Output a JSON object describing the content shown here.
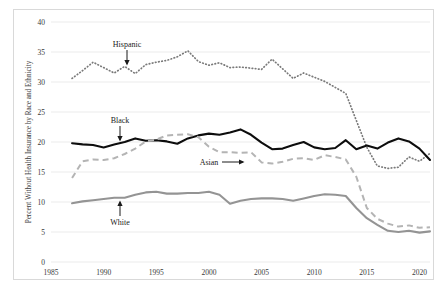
{
  "chart_data": {
    "type": "line",
    "title": "",
    "xlabel": "",
    "ylabel": "Percent Without Health Insurance by Race and Ethnicity",
    "xlim": [
      1985,
      2021
    ],
    "ylim": [
      0,
      40
    ],
    "yticks": [
      0,
      5,
      10,
      15,
      20,
      25,
      30,
      35,
      40
    ],
    "xticks": [
      1985,
      1990,
      1995,
      2000,
      2005,
      2010,
      2015,
      2020
    ],
    "grid": true,
    "legend_position": "inline-annotations",
    "x": [
      1987,
      1988,
      1989,
      1990,
      1991,
      1992,
      1993,
      1994,
      1995,
      1996,
      1997,
      1998,
      1999,
      2000,
      2001,
      2002,
      2003,
      2004,
      2005,
      2006,
      2007,
      2008,
      2009,
      2010,
      2011,
      2012,
      2013,
      2014,
      2015,
      2016,
      2017,
      2018,
      2019,
      2020,
      2021
    ],
    "series": [
      {
        "name": "Hispanic",
        "style": "dotted",
        "color": "#7a7a7a",
        "values": [
          30.6,
          31.9,
          33.3,
          32.4,
          31.5,
          32.6,
          31.4,
          32.9,
          33.3,
          33.6,
          34.2,
          35.2,
          33.4,
          32.8,
          33.2,
          32.4,
          32.5,
          32.3,
          32.1,
          33.8,
          32.2,
          30.6,
          31.5,
          30.8,
          30.1,
          29.1,
          28.1,
          23.6,
          19.1,
          16.0,
          15.6,
          15.8,
          17.5,
          16.8,
          18.1
        ]
      },
      {
        "name": "Black",
        "style": "solid",
        "color": "#0d0d0d",
        "values": [
          19.8,
          19.6,
          19.5,
          19.1,
          19.6,
          20.0,
          20.6,
          20.2,
          20.3,
          20.1,
          19.7,
          20.6,
          21.1,
          21.4,
          21.2,
          21.6,
          22.1,
          21.2,
          19.9,
          18.8,
          18.9,
          19.5,
          20.0,
          19.1,
          18.8,
          19.0,
          20.3,
          18.8,
          19.4,
          18.9,
          19.9,
          20.6,
          20.1,
          18.9,
          17.0
        ]
      },
      {
        "name": "Asian",
        "style": "dashed",
        "color": "#b4b4b4",
        "values": [
          14.0,
          16.8,
          17.1,
          17.0,
          17.3,
          18.0,
          18.9,
          20.1,
          20.4,
          21.1,
          21.2,
          21.3,
          20.8,
          19.2,
          18.3,
          18.3,
          18.2,
          18.3,
          16.6,
          16.4,
          16.7,
          17.2,
          17.3,
          17.0,
          17.8,
          17.5,
          17.1,
          14.2,
          9.0,
          7.2,
          6.4,
          5.9,
          6.1,
          5.7,
          5.8
        ]
      },
      {
        "name": "White",
        "style": "solid",
        "color": "#949494",
        "values": [
          9.8,
          10.1,
          10.3,
          10.5,
          10.7,
          10.7,
          11.2,
          11.6,
          11.7,
          11.4,
          11.4,
          11.5,
          11.5,
          11.7,
          11.2,
          9.7,
          10.2,
          10.5,
          10.6,
          10.6,
          10.5,
          10.2,
          10.6,
          11.0,
          11.3,
          11.2,
          11.0,
          9.0,
          7.3,
          6.2,
          5.2,
          5.0,
          5.2,
          4.9,
          5.1
        ]
      }
    ],
    "annotations": [
      {
        "label": "Hispanic",
        "arrow": "down",
        "x": 1991,
        "label_x_px": 127,
        "label_y_px": 47
      },
      {
        "label": "Black",
        "arrow": "down",
        "x": 1991,
        "label_x_px": 120,
        "label_y_px": 123
      },
      {
        "label": "Asian",
        "arrow": "right",
        "x": 2004,
        "label_x_px": 209,
        "label_y_px": 165
      },
      {
        "label": "White",
        "arrow": "up",
        "x": 1991,
        "label_x_px": 120,
        "label_y_px": 225
      }
    ]
  },
  "axis": {
    "ytick_labels": [
      "0",
      "5",
      "10",
      "15",
      "20",
      "25",
      "30",
      "35",
      "40"
    ],
    "xtick_labels": [
      "1985",
      "1990",
      "1995",
      "2000",
      "2005",
      "2010",
      "2015",
      "2020"
    ],
    "ylabel": "Percent Without Health Insurance by Race and Ethnicity"
  },
  "annotation_labels": {
    "hispanic": "Hispanic",
    "black": "Black",
    "asian": "Asian",
    "white": "White"
  }
}
